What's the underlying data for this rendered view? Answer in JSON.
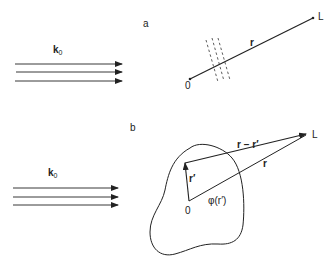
{
  "panel_a": {
    "label": "a",
    "wavevector": {
      "main": "k",
      "sub": "0"
    },
    "origin": "0",
    "endpoint": "L",
    "vector": "r"
  },
  "panel_b": {
    "label": "b",
    "wavevector": {
      "main": "k",
      "sub": "0"
    },
    "origin": "0",
    "endpoint": "L",
    "vector_r": "r",
    "vector_r_prime": "r′",
    "vector_diff": "r − r′",
    "potential": "φ(r′)"
  },
  "colors": {
    "ink": "#222222",
    "background": "#ffffff"
  }
}
